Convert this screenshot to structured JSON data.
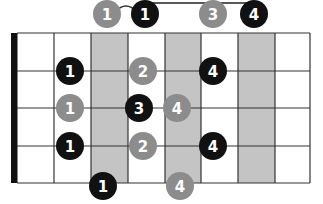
{
  "diagram": {
    "type": "guitar-fretboard-scale-diagram",
    "colors": {
      "root_note": "#111111",
      "other_note": "#8c8c8c",
      "shaded_fret": "#c4c4c4",
      "line": "#333333",
      "nut": "#111111",
      "background": "#ffffff"
    },
    "grid": {
      "left": 17,
      "right": 310,
      "top": 33,
      "bottom": 183,
      "fret_x": [
        17,
        54,
        91,
        128,
        165,
        201,
        238,
        275,
        310
      ],
      "string_y": [
        33,
        71,
        108,
        146,
        183
      ],
      "shaded_columns": [
        [
          91,
          128
        ],
        [
          165,
          201
        ],
        [
          238,
          275
        ]
      ],
      "nut": {
        "x": 11,
        "width": 6
      }
    },
    "bracket": {
      "x1": 145,
      "x2": 255,
      "y": 3,
      "tick_bottom": 6
    },
    "slur": {
      "from_x": 107,
      "to_x": 145,
      "y": 10
    },
    "notes": [
      {
        "x": 107,
        "y": 14,
        "color": "gray",
        "finger": "1"
      },
      {
        "x": 145,
        "y": 14,
        "color": "black",
        "finger": "1"
      },
      {
        "x": 213,
        "y": 14,
        "color": "gray",
        "finger": "3"
      },
      {
        "x": 254,
        "y": 14,
        "color": "black",
        "finger": "4"
      },
      {
        "x": 70,
        "y": 71,
        "color": "black",
        "finger": "1"
      },
      {
        "x": 143,
        "y": 71,
        "color": "gray",
        "finger": "2"
      },
      {
        "x": 213,
        "y": 71,
        "color": "black",
        "finger": "4"
      },
      {
        "x": 70,
        "y": 108,
        "color": "gray",
        "finger": "1"
      },
      {
        "x": 139,
        "y": 108,
        "color": "black",
        "finger": "3"
      },
      {
        "x": 177,
        "y": 108,
        "color": "gray",
        "finger": "4"
      },
      {
        "x": 70,
        "y": 146,
        "color": "black",
        "finger": "1"
      },
      {
        "x": 143,
        "y": 146,
        "color": "gray",
        "finger": "2"
      },
      {
        "x": 213,
        "y": 146,
        "color": "black",
        "finger": "4"
      },
      {
        "x": 103,
        "y": 186,
        "color": "black",
        "finger": "1"
      },
      {
        "x": 180,
        "y": 186,
        "color": "gray",
        "finger": "4"
      }
    ],
    "note_radius": 14
  }
}
